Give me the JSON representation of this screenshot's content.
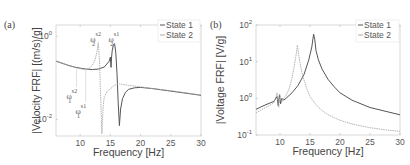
{
  "chart_data": [
    {
      "type": "line",
      "panel_label": "(a)",
      "xlabel": "Frequency [Hz]",
      "ylabel": "|Velocity FRF| [(m/s)/g]",
      "xlim": [
        6,
        30
      ],
      "ylim_log10": [
        -2.4,
        0.27
      ],
      "yscale": "log",
      "xticks": [
        10,
        15,
        20,
        25,
        30
      ],
      "xtick_labels": [
        "10",
        "15",
        "20",
        "25",
        "30"
      ],
      "yticks_log10": [
        0,
        -2
      ],
      "ytick_labels": [
        {
          "base": "10",
          "exp": "0"
        },
        {
          "base": "10",
          "exp": "-2"
        }
      ],
      "legend": {
        "placement": "top-right",
        "entries": [
          "State 1",
          "State 2"
        ]
      },
      "annotations": [
        {
          "sym": "ω",
          "sub": "2",
          "sup": "s2",
          "x": 13.0
        },
        {
          "sym": "ω",
          "sub": "2",
          "sup": "s1",
          "x": 15.7
        },
        {
          "sym": "ω",
          "sub": "1",
          "sup": "s2",
          "x": 9.4
        },
        {
          "sym": "ω",
          "sub": "1",
          "sup": "s1",
          "x": 10.9
        }
      ],
      "series": [
        {
          "name": "State 1",
          "color": "#555555",
          "x": [
            6,
            7,
            8,
            9,
            10,
            11,
            12,
            13,
            14,
            14.8,
            15.0,
            15.1,
            15.2,
            15.3,
            15.5,
            15.7,
            15.9,
            16.1,
            16.3,
            16.5,
            16.7,
            17.0,
            17.5,
            18,
            19,
            20,
            22,
            25,
            28,
            30
          ],
          "y_log10": [
            -0.6,
            -0.65,
            -0.7,
            -0.74,
            -0.77,
            -0.79,
            -0.8,
            -0.79,
            -0.74,
            -0.6,
            -0.5,
            -0.75,
            -0.5,
            -0.35,
            -0.2,
            -0.18,
            -0.4,
            -0.9,
            -1.6,
            -2.15,
            -1.75,
            -1.5,
            -1.35,
            -1.28,
            -1.24,
            -1.23,
            -1.26,
            -1.32,
            -1.38,
            -1.42
          ]
        },
        {
          "name": "State 2",
          "color": "#aaaaaa",
          "x": [
            6,
            7,
            8,
            9,
            9.4,
            10,
            10.9,
            11,
            11.5,
            12,
            12.5,
            12.8,
            13.0,
            13.2,
            13.4,
            13.6,
            13.8,
            14,
            14.5,
            15,
            15.5,
            16,
            16.5,
            17,
            18,
            20,
            22,
            25,
            28,
            30
          ],
          "y_log10": [
            -0.6,
            -0.65,
            -0.7,
            -0.74,
            -0.76,
            -0.78,
            -0.8,
            -0.8,
            -0.77,
            -0.7,
            -0.55,
            -0.35,
            -0.15,
            -0.6,
            -1.5,
            -2.35,
            -1.7,
            -1.45,
            -1.32,
            -1.27,
            -1.2,
            -1.16,
            -1.15,
            -1.16,
            -1.18,
            -1.22,
            -1.26,
            -1.31,
            -1.37,
            -1.42
          ]
        }
      ]
    },
    {
      "type": "line",
      "panel_label": "(b)",
      "xlabel": "Frequency [Hz]",
      "ylabel": "|Voltage FRF| [V/g]",
      "xlim": [
        6,
        30
      ],
      "ylim_log10": [
        -1,
        2
      ],
      "yscale": "log",
      "xticks": [
        10,
        15,
        20,
        25,
        30
      ],
      "xtick_labels": [
        "10",
        "15",
        "20",
        "25",
        "30"
      ],
      "yticks_log10": [
        2,
        1,
        0,
        -1
      ],
      "ytick_labels": [
        {
          "base": "10",
          "exp": "2"
        },
        {
          "base": "10",
          "exp": "1"
        },
        {
          "base": "10",
          "exp": "0"
        },
        {
          "base": "10",
          "exp": "-1"
        }
      ],
      "legend": {
        "placement": "top-right",
        "entries": [
          "State 1",
          "State 2"
        ]
      },
      "series": [
        {
          "name": "State 1",
          "color": "#555555",
          "x": [
            6,
            7,
            8,
            9,
            9.5,
            9.7,
            9.9,
            10.1,
            10.3,
            10.6,
            11,
            12,
            13,
            14,
            14.8,
            15.3,
            15.6,
            15.8,
            16.0,
            16.4,
            17,
            18,
            19,
            20,
            22,
            25,
            28,
            30
          ],
          "y_log10": [
            -0.3,
            -0.22,
            -0.15,
            -0.08,
            0.05,
            -0.2,
            0.1,
            -0.15,
            0.0,
            -0.05,
            0.0,
            0.15,
            0.35,
            0.65,
            1.05,
            1.4,
            1.75,
            1.6,
            1.3,
            1.05,
            0.8,
            0.52,
            0.32,
            0.15,
            -0.05,
            -0.25,
            -0.37,
            -0.45
          ]
        },
        {
          "name": "State 2",
          "color": "#aaaaaa",
          "x": [
            6,
            7,
            8,
            9,
            9.5,
            9.8,
            10,
            10.3,
            10.6,
            11,
            11.5,
            12,
            12.4,
            12.7,
            12.9,
            13.1,
            13.4,
            13.8,
            14.5,
            15,
            16,
            17,
            18,
            20,
            22,
            25,
            28,
            30
          ],
          "y_log10": [
            -0.4,
            -0.3,
            -0.22,
            -0.12,
            0.15,
            -0.25,
            0.1,
            -0.1,
            0.0,
            0.08,
            0.25,
            0.55,
            0.9,
            1.2,
            1.45,
            1.2,
            0.9,
            0.6,
            0.25,
            0.05,
            -0.18,
            -0.33,
            -0.45,
            -0.6,
            -0.7,
            -0.8,
            -0.87,
            -0.9
          ]
        }
      ]
    }
  ]
}
